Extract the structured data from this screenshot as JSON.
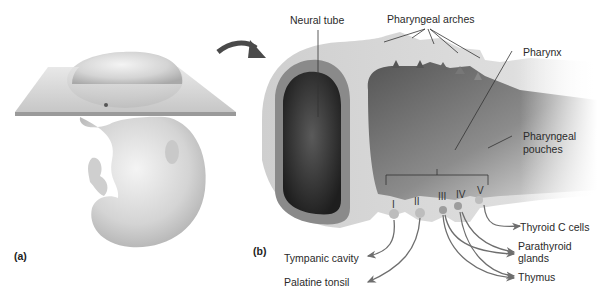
{
  "figure": {
    "panels": [
      {
        "id": "a",
        "label": "(a)"
      },
      {
        "id": "b",
        "label": "(b)"
      }
    ],
    "top_labels": {
      "neural_tube": "Neural tube",
      "pharyngeal_arches": "Pharyngeal arches",
      "pharynx": "Pharynx",
      "pharyngeal_pouches_line1": "Pharyngeal",
      "pharyngeal_pouches_line2": "pouches"
    },
    "pouch_numerals": [
      "I",
      "II",
      "III",
      "IV",
      "V"
    ],
    "derivatives": {
      "tympanic_cavity": "Tympanic cavity",
      "palatine_tonsil": "Palatine tonsil",
      "thyroid_c_cells": "Thyroid C cells",
      "parathyroid_line1": "Parathyroid",
      "parathyroid_line2": "glands",
      "thymus": "Thymus"
    },
    "colors": {
      "arrow": "#6e6e6e",
      "outer_tissue": "#d9d9d9",
      "neural_ring": "#8a8a8a",
      "neural_lumen": "#2e2e2e",
      "pharynx_dark": "#6a6a6a",
      "plane": "#c8c8c8"
    }
  }
}
